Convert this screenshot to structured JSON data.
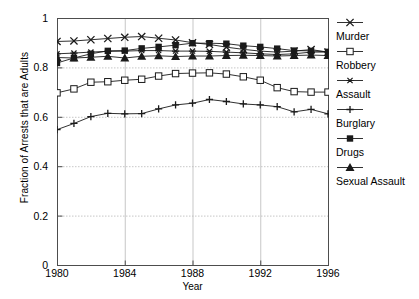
{
  "chart_data": {
    "type": "line",
    "title": "",
    "xlabel": "Year",
    "ylabel": "Fraction of Arrests that are Adults",
    "xlim": [
      1980,
      1996
    ],
    "ylim": [
      0,
      1
    ],
    "xticks": [
      "1980",
      "1984",
      "1988",
      "1992",
      "1996"
    ],
    "yticks": [
      "0",
      "0.2",
      "0.4",
      "0.6",
      "0.8",
      "1"
    ],
    "grid": true,
    "legend_position": "right",
    "x": [
      1980,
      1981,
      1982,
      1983,
      1984,
      1985,
      1986,
      1987,
      1988,
      1989,
      1990,
      1991,
      1992,
      1993,
      1994,
      1995,
      1996
    ],
    "series": [
      {
        "name": "Murder",
        "marker": "x",
        "values": [
          0.905,
          0.907,
          0.912,
          0.917,
          0.922,
          0.925,
          0.918,
          0.911,
          0.9,
          0.893,
          0.882,
          0.873,
          0.866,
          0.862,
          0.866,
          0.872,
          0.862
        ]
      },
      {
        "name": "Robbery",
        "marker": "open-square",
        "values": [
          0.697,
          0.713,
          0.74,
          0.742,
          0.748,
          0.752,
          0.765,
          0.775,
          0.777,
          0.778,
          0.773,
          0.762,
          0.748,
          0.718,
          0.702,
          0.7,
          0.7
        ]
      },
      {
        "name": "Assault",
        "marker": "asterisk",
        "values": [
          0.855,
          0.858,
          0.862,
          0.865,
          0.866,
          0.868,
          0.868,
          0.866,
          0.866,
          0.865,
          0.862,
          0.859,
          0.855,
          0.852,
          0.855,
          0.862,
          0.862
        ]
      },
      {
        "name": "Burglary",
        "marker": "plus",
        "values": [
          0.548,
          0.573,
          0.601,
          0.614,
          0.612,
          0.613,
          0.632,
          0.648,
          0.655,
          0.67,
          0.662,
          0.652,
          0.648,
          0.641,
          0.62,
          0.63,
          0.612
        ]
      },
      {
        "name": "Drugs",
        "marker": "filled-square",
        "values": [
          0.818,
          0.838,
          0.855,
          0.867,
          0.868,
          0.877,
          0.883,
          0.89,
          0.898,
          0.898,
          0.896,
          0.888,
          0.883,
          0.876,
          0.868,
          0.867,
          0.863
        ]
      },
      {
        "name": "Sexual Assault",
        "marker": "filled-triangle",
        "values": [
          0.84,
          0.838,
          0.841,
          0.845,
          0.838,
          0.845,
          0.847,
          0.844,
          0.846,
          0.846,
          0.848,
          0.849,
          0.848,
          0.846,
          0.848,
          0.85,
          0.848
        ]
      }
    ],
    "colors": {
      "line": "#1a1a1a",
      "grid": "#b9b9b9",
      "axis": "#4d4d4d",
      "background": "#ffffff"
    }
  },
  "legend": {
    "items": [
      {
        "label": "Murder"
      },
      {
        "label": "Robbery"
      },
      {
        "label": "Assault"
      },
      {
        "label": "Burglary"
      },
      {
        "label": "Drugs"
      },
      {
        "label": "Sexual Assault"
      }
    ]
  }
}
